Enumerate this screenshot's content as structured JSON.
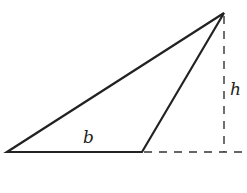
{
  "diagram": {
    "type": "geometry",
    "labels": {
      "base": "b",
      "height": "h"
    },
    "vertices": {
      "left": [
        7,
        152
      ],
      "right_base": [
        142,
        152
      ],
      "apex": [
        224,
        13
      ]
    },
    "colors": {
      "stroke": "#222222",
      "background": "#ffffff"
    }
  }
}
